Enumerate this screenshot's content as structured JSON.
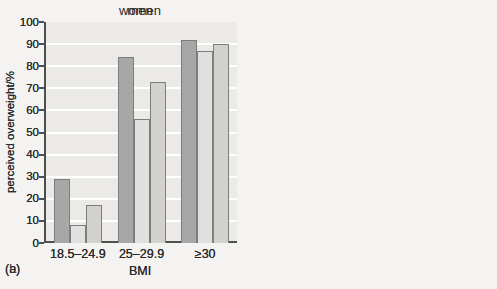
{
  "colors": {
    "page_bg": "#f4f3f1",
    "plot_bg": "#ebeae7",
    "gridline": "#ffffff",
    "axis": "#4f4f4f",
    "text": "#2b2b2b",
    "bar_border": "#7d7d7d",
    "legend_bg": "#edece9",
    "legend_border": "#9a9a9a",
    "series": {
      "white": "#a7a7a7",
      "black": "#e0e0de",
      "hispanic": "#d2d1ce"
    }
  },
  "legend": {
    "entries": [
      {
        "label": "white",
        "series": "white"
      },
      {
        "label": "black",
        "series": "black"
      },
      {
        "label": "hispanic",
        "series": "hispanic"
      }
    ]
  },
  "chart_data": [
    {
      "type": "bar",
      "panel_label": "(a)",
      "title": "men",
      "xlabel": "BMI",
      "ylabel": "perceived overweight/%",
      "ylim": [
        0,
        100
      ],
      "ytick_step": 10,
      "grid": true,
      "legend_visible": true,
      "legend_position": "upper-left-inside",
      "categories": [
        "18.5–24.9",
        "25–29.9",
        "≥30"
      ],
      "series": [
        {
          "name": "white",
          "values": [
            8,
            53,
            86
          ]
        },
        {
          "name": "black",
          "values": [
            2,
            37,
            65
          ]
        },
        {
          "name": "hispanic",
          "values": [
            17,
            33,
            78
          ]
        }
      ]
    },
    {
      "type": "bar",
      "panel_label": "(b)",
      "title": "women",
      "xlabel": "BMI",
      "ylabel": "perceived overweight/%",
      "ylim": [
        0,
        100
      ],
      "ytick_step": 10,
      "grid": true,
      "legend_visible": false,
      "categories": [
        "18.5–24.9",
        "25–29.9",
        "≥30"
      ],
      "series": [
        {
          "name": "white",
          "values": [
            29,
            84,
            92
          ]
        },
        {
          "name": "black",
          "values": [
            8,
            56,
            87
          ]
        },
        {
          "name": "hispanic",
          "values": [
            17,
            73,
            90
          ]
        }
      ]
    }
  ]
}
